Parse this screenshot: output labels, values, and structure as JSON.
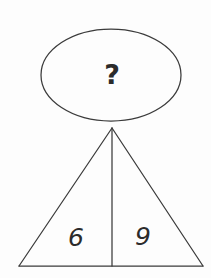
{
  "diagram": {
    "type": "puzzle-diagram",
    "background_color": "#fdfdfd",
    "stroke_color": "#3b3b3b",
    "text_color": "#2b2b2b",
    "bubble": {
      "shape": "ellipse",
      "label": "?",
      "center_x": 111,
      "center_y": 75,
      "radius_x": 70,
      "radius_y": 46
    },
    "triangle": {
      "apex_x": 112,
      "apex_y": 128,
      "base_left_x": 19,
      "base_right_x": 203,
      "base_y": 266,
      "divider_x": 112,
      "segments": [
        {
          "position": "left",
          "label": "6",
          "label_x": 76,
          "label_y": 238
        },
        {
          "position": "right",
          "label": "9",
          "label_x": 143,
          "label_y": 238
        }
      ]
    }
  }
}
